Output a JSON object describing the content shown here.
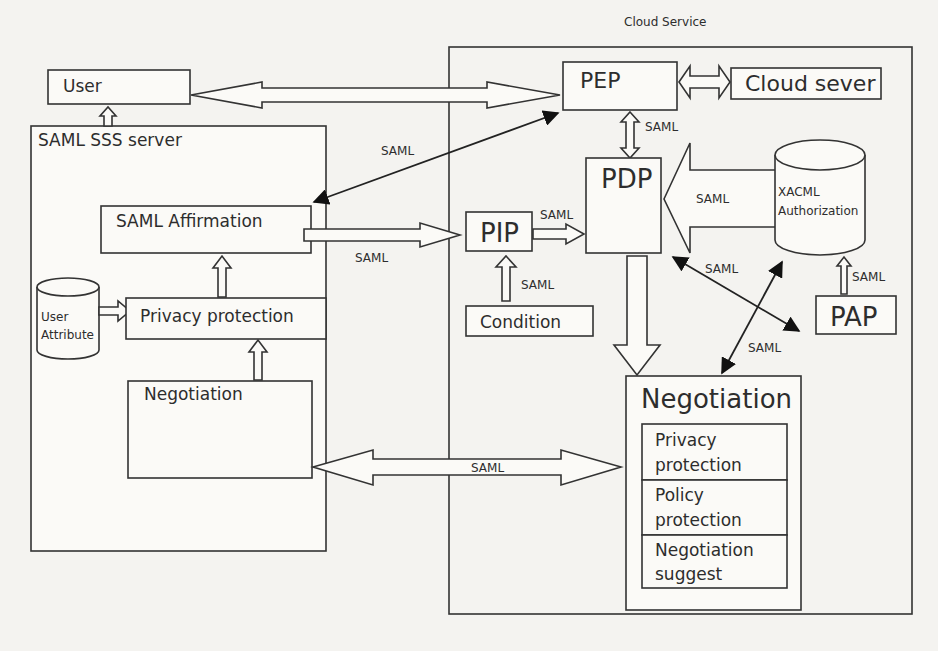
{
  "diagram": {
    "cloud_service_label": "Cloud Service",
    "nodes": {
      "user": "User",
      "saml_server": "SAML  SSS server",
      "saml_affirmation": "SAML Affirmation",
      "privacy_protection": "Privacy protection",
      "user_attribute_line1": "User",
      "user_attribute_line2": "Attribute",
      "negotiation_left": "Negotiation",
      "pep": "PEP",
      "cloud_sever": "Cloud sever",
      "pdp": "PDP",
      "pip": "PIP",
      "condition": "Condition",
      "xacml_line1": "XACML",
      "xacml_line2": "Authorization",
      "pap": "PAP",
      "negotiation_right": "Negotiation",
      "sub_privacy_line1": "Privacy",
      "sub_privacy_line2": "protection",
      "sub_policy_line1": "Policy",
      "sub_policy_line2": "protection",
      "sub_suggest_line1": "Negotiation",
      "sub_suggest_line2": "suggest"
    },
    "edge_labels": {
      "server_to_pep": "SAML",
      "pep_pdp": "SAML",
      "affirmation_to_pip": "SAML",
      "pip_to_pdp": "SAML",
      "xacml_to_pdp": "SAML",
      "condition_to_pip": "SAML",
      "pdp_pap": "SAML",
      "pap_to_xacml": "SAML",
      "pap_to_negotiation": "SAML",
      "negotiation_link": "SAML"
    }
  }
}
